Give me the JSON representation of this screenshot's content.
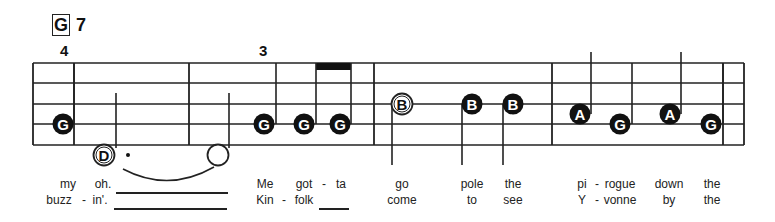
{
  "chord": {
    "root": "G",
    "extension": "7"
  },
  "fingerings": [
    {
      "label": "4",
      "x": 64,
      "y": 42
    },
    {
      "label": "3",
      "x": 263,
      "y": 42
    }
  ],
  "staff": {
    "left": 33,
    "right": 744,
    "lines_y": [
      63,
      83,
      104,
      124,
      145
    ],
    "barlines_x": [
      33,
      74,
      189,
      374,
      552,
      723,
      744
    ]
  },
  "notes": [
    {
      "name": "G",
      "x": 63,
      "y": 124,
      "filled": true,
      "stem": {
        "x": 74,
        "y1": 63,
        "y2": 124
      }
    },
    {
      "name": "D",
      "x": 104,
      "y": 155,
      "filled": false,
      "stem": {
        "x": 116,
        "y1": 93,
        "y2": 148
      },
      "dot": true
    },
    {
      "name": "",
      "x": 218,
      "y": 155,
      "filled": false,
      "hollow_half": true,
      "stem": {
        "x": 229,
        "y1": 93,
        "y2": 148
      }
    },
    {
      "name": "G",
      "x": 264,
      "y": 124,
      "filled": true,
      "stem": {
        "x": 276,
        "y1": 63,
        "y2": 124
      }
    },
    {
      "name": "G",
      "x": 304,
      "y": 124,
      "filled": true,
      "stem": {
        "x": 316,
        "y1": 63,
        "y2": 124
      }
    },
    {
      "name": "G",
      "x": 340,
      "y": 124,
      "filled": true,
      "stem": {
        "x": 351,
        "y1": 63,
        "y2": 124
      }
    },
    {
      "name": "B",
      "x": 402,
      "y": 104,
      "filled": false,
      "stem": {
        "x": 392,
        "y1": 104,
        "y2": 165
      }
    },
    {
      "name": "B",
      "x": 472,
      "y": 104,
      "filled": true,
      "stem": {
        "x": 462,
        "y1": 104,
        "y2": 165
      }
    },
    {
      "name": "B",
      "x": 513,
      "y": 104,
      "filled": true,
      "stem": {
        "x": 503,
        "y1": 104,
        "y2": 165
      }
    },
    {
      "name": "A",
      "x": 580,
      "y": 114,
      "filled": true,
      "stem": {
        "x": 591,
        "y1": 52,
        "y2": 114
      }
    },
    {
      "name": "G",
      "x": 620,
      "y": 124,
      "filled": true,
      "stem": {
        "x": 632,
        "y1": 63,
        "y2": 124
      }
    },
    {
      "name": "A",
      "x": 670,
      "y": 114,
      "filled": true,
      "stem": {
        "x": 681,
        "y1": 52,
        "y2": 114
      }
    },
    {
      "name": "G",
      "x": 711,
      "y": 124,
      "filled": true,
      "stem": {
        "x": 723,
        "y1": 63,
        "y2": 124
      }
    }
  ],
  "beam": {
    "x1": 316,
    "x2": 351,
    "y": 63,
    "h": 7
  },
  "tie": {
    "x1": 123,
    "x2": 214,
    "y": 169,
    "depth": 12
  },
  "lyrics": {
    "verse1": [
      {
        "text": "my",
        "x": 68
      },
      {
        "text": "oh.",
        "x": 103
      },
      {
        "text": "Me",
        "x": 265
      },
      {
        "text": "got",
        "x": 304
      },
      {
        "text": "-",
        "x": 324
      },
      {
        "text": "ta",
        "x": 341
      },
      {
        "text": "go",
        "x": 402
      },
      {
        "text": "pole",
        "x": 472
      },
      {
        "text": "the",
        "x": 513
      },
      {
        "text": "pi",
        "x": 582
      },
      {
        "text": "-",
        "x": 597
      },
      {
        "text": "rogue",
        "x": 620
      },
      {
        "text": "down",
        "x": 669
      },
      {
        "text": "the",
        "x": 712
      }
    ],
    "verse2": [
      {
        "text": "buzz",
        "x": 59
      },
      {
        "text": "-",
        "x": 84
      },
      {
        "text": "in'.",
        "x": 100
      },
      {
        "text": "Kin",
        "x": 265
      },
      {
        "text": "-",
        "x": 284
      },
      {
        "text": "folk",
        "x": 304
      },
      {
        "text": "come",
        "x": 402
      },
      {
        "text": "to",
        "x": 472
      },
      {
        "text": "see",
        "x": 513
      },
      {
        "text": "Y",
        "x": 582
      },
      {
        "text": "-",
        "x": 597
      },
      {
        "text": "vonne",
        "x": 620
      },
      {
        "text": "by",
        "x": 669
      },
      {
        "text": "the",
        "x": 712
      }
    ],
    "extenders": [
      {
        "x1": 116,
        "x2": 228,
        "y": 192
      },
      {
        "x1": 114,
        "x2": 227,
        "y": 208
      },
      {
        "x1": 319,
        "x2": 349,
        "y": 208
      }
    ]
  }
}
